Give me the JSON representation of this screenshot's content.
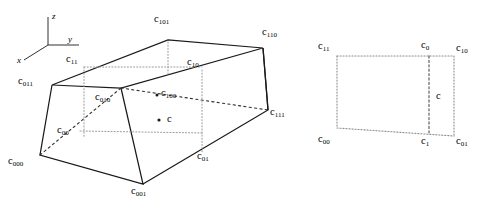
{
  "figure": {
    "title": "",
    "axes": {
      "x": "x",
      "y": "y",
      "z": "z"
    },
    "left_diagram": {
      "name": "3d-cell-diagram",
      "vertices": [
        {
          "id": "c011",
          "label": "c",
          "sub": "011",
          "x": 52,
          "y": 85,
          "lx": 18,
          "ly": 76
        },
        {
          "id": "c101",
          "label": "c",
          "sub": "101",
          "x": 168,
          "y": 40,
          "lx": 154,
          "ly": 14
        },
        {
          "id": "c110",
          "label": "c",
          "sub": "110",
          "x": 263,
          "y": 48,
          "lx": 262,
          "ly": 27
        },
        {
          "id": "c010",
          "label": "c",
          "sub": "010",
          "x": 121,
          "y": 88,
          "lx": 95,
          "ly": 92
        },
        {
          "id": "c000",
          "label": "c",
          "sub": "000",
          "x": 40,
          "y": 155,
          "lx": 8,
          "ly": 156
        },
        {
          "id": "c001",
          "label": "c",
          "sub": "001",
          "x": 143,
          "y": 184,
          "lx": 131,
          "ly": 186
        },
        {
          "id": "c111",
          "label": "c",
          "sub": "111",
          "x": 268,
          "y": 110,
          "lx": 270,
          "ly": 107
        }
      ],
      "face_centres": [
        {
          "id": "c11",
          "label": "c",
          "sub": "11",
          "x": 84,
          "y": 72,
          "lx": 66,
          "ly": 54
        },
        {
          "id": "c10",
          "label": "c",
          "sub": "10",
          "x": 202,
          "y": 72,
          "lx": 187,
          "ly": 57
        },
        {
          "id": "c00",
          "label": "c",
          "sub": "00",
          "x": 78,
          "y": 131,
          "lx": 57,
          "ly": 125
        },
        {
          "id": "c01",
          "label": "c",
          "sub": "01",
          "x": 203,
          "y": 152,
          "lx": 197,
          "ly": 151
        },
        {
          "id": "c100",
          "label": "c",
          "sub": "100",
          "x": 159,
          "y": 96,
          "lx": 161,
          "ly": 88
        }
      ],
      "cell_centre": {
        "id": "c",
        "label": "c",
        "sub": "",
        "x": 161,
        "y": 120,
        "lx": 168,
        "ly": 113
      }
    },
    "right_diagram": {
      "name": "2d-cell-diagram",
      "corners": [
        {
          "id": "c11",
          "label": "c",
          "sub": "11",
          "x": 337,
          "y": 56,
          "lx": 318,
          "ly": 41
        },
        {
          "id": "c10",
          "label": "c",
          "sub": "10",
          "x": 454,
          "y": 56,
          "lx": 456,
          "ly": 43
        },
        {
          "id": "c00",
          "label": "c",
          "sub": "00",
          "x": 337,
          "y": 128,
          "lx": 318,
          "ly": 134
        },
        {
          "id": "c01",
          "label": "c",
          "sub": "01",
          "x": 454,
          "y": 136,
          "lx": 456,
          "ly": 136
        }
      ],
      "edge_centres": [
        {
          "id": "c0",
          "label": "c",
          "sub": "0",
          "x": 429,
          "y": 56,
          "lx": 421,
          "ly": 40
        },
        {
          "id": "c1",
          "label": "c",
          "sub": "1",
          "x": 429,
          "y": 133,
          "lx": 421,
          "ly": 136
        }
      ],
      "cell_centre": {
        "id": "c",
        "label": "c",
        "sub": "",
        "x": 429,
        "y": 96,
        "lx": 435,
        "ly": 90
      }
    },
    "colors": {
      "stroke": "#1a1a1a",
      "dotted": "#808080",
      "dashed": "#303030",
      "background": "#ffffff",
      "text": "#000000"
    }
  }
}
